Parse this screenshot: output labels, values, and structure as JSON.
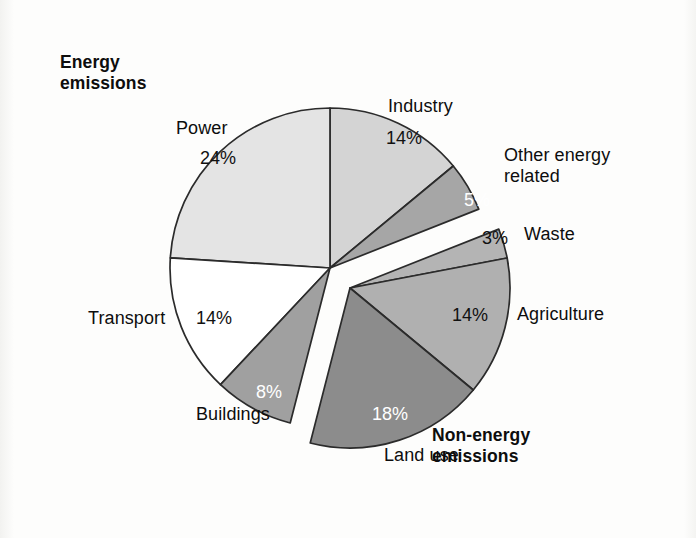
{
  "figure": {
    "background_color": "#fdfdfc",
    "groups": [
      {
        "id": "energy",
        "label_line1": "Energy",
        "label_line2": "emissions"
      },
      {
        "id": "non_energy",
        "label_line1": "Non-energy",
        "label_line2": "emissions"
      }
    ]
  },
  "chart_data": {
    "type": "pie",
    "title": "",
    "subtitle": "",
    "xlabel": "",
    "ylabel": "",
    "legend_position": "none",
    "grid": false,
    "units": "percent",
    "total": 100,
    "start_angle_deg": 0,
    "direction": "clockwise",
    "groups": [
      {
        "name": "Energy emissions",
        "subtotal": 65,
        "exploded": false,
        "slices": [
          "Industry",
          "Other energy related",
          "Waste-gap",
          "Transport",
          "Buildings",
          "Power"
        ]
      },
      {
        "name": "Non-energy emissions",
        "subtotal": 35,
        "exploded": true,
        "slices": [
          "Waste",
          "Agriculture",
          "Land use"
        ]
      }
    ],
    "categories": [
      "Industry",
      "Other energy related",
      "Waste",
      "Agriculture",
      "Land use",
      "Buildings",
      "Transport",
      "Power"
    ],
    "values": [
      14,
      5,
      3,
      14,
      18,
      8,
      14,
      24
    ],
    "labels": [
      "14%",
      "5%",
      "3%",
      "14%",
      "18%",
      "8%",
      "14%",
      "24%"
    ],
    "slice_colors": [
      "#d4d4d4",
      "#a6a6a6",
      "#b4b4b4",
      "#b0b0b0",
      "#8c8c8c",
      "#a0a0a0",
      "#ffffff",
      "#e4e4e4"
    ],
    "label_text_colors": [
      "#111111",
      "#ffffff",
      "#111111",
      "#111111",
      "#ffffff",
      "#ffffff",
      "#111111",
      "#111111"
    ],
    "group_of": [
      "energy",
      "energy",
      "non_energy",
      "non_energy",
      "non_energy",
      "energy",
      "energy",
      "energy"
    ],
    "stroke_color": "#2b2b2b"
  },
  "annotations": {
    "energy_title_line1": "Energy",
    "energy_title_line2": "emissions",
    "non_energy_title_line1": "Non-energy",
    "non_energy_title_line2": "emissions",
    "cat_industry": "Industry",
    "cat_other_energy_line1": "Other energy",
    "cat_other_energy_line2": "related",
    "cat_waste": "Waste",
    "cat_agriculture": "Agriculture",
    "cat_land_use": "Land use",
    "cat_buildings": "Buildings",
    "cat_transport": "Transport",
    "cat_power": "Power",
    "pct_industry": "14%",
    "pct_other_energy": "5%",
    "pct_waste": "3%",
    "pct_agriculture": "14%",
    "pct_land_use": "18%",
    "pct_buildings": "8%",
    "pct_transport": "14%",
    "pct_power": "24%"
  }
}
